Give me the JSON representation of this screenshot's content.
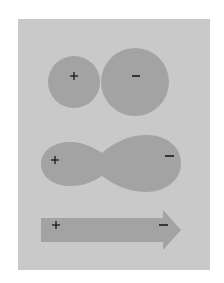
{
  "figure": {
    "background": "#ffffff",
    "panel_color": "#c9c9c9",
    "shape_color": "#a3a3a3",
    "sign_color": "#1a1a1a"
  },
  "panels": [
    {
      "name": "two-spheres",
      "description": "Two touching circles, smaller positive on left, larger negative on right",
      "positive_label": "+",
      "negative_label": "−"
    },
    {
      "name": "peanut",
      "description": "Merged peanut shape, small lobe positive, large lobe negative",
      "positive_label": "+",
      "negative_label": "−"
    },
    {
      "name": "arrow",
      "description": "Right-pointing arrow, positive at tail, negative near head",
      "positive_label": "+",
      "negative_label": "−"
    }
  ]
}
